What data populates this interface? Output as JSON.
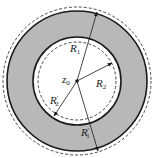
{
  "diagram": {
    "type": "annulus",
    "center_label": "z",
    "center_sub": "0",
    "labels": [
      {
        "id": "R1",
        "main": "R",
        "sub": "1",
        "prime": ""
      },
      {
        "id": "R2",
        "main": "R",
        "sub": "2",
        "prime": ""
      },
      {
        "id": "R2p",
        "main": "R",
        "sub": "2",
        "prime": "′"
      },
      {
        "id": "R1p",
        "main": "R",
        "sub": "1",
        "prime": "′"
      }
    ],
    "colors": {
      "ring_fill": "#b8b8b8",
      "stroke": "#1a1a1a",
      "background": "#ffffff"
    }
  }
}
